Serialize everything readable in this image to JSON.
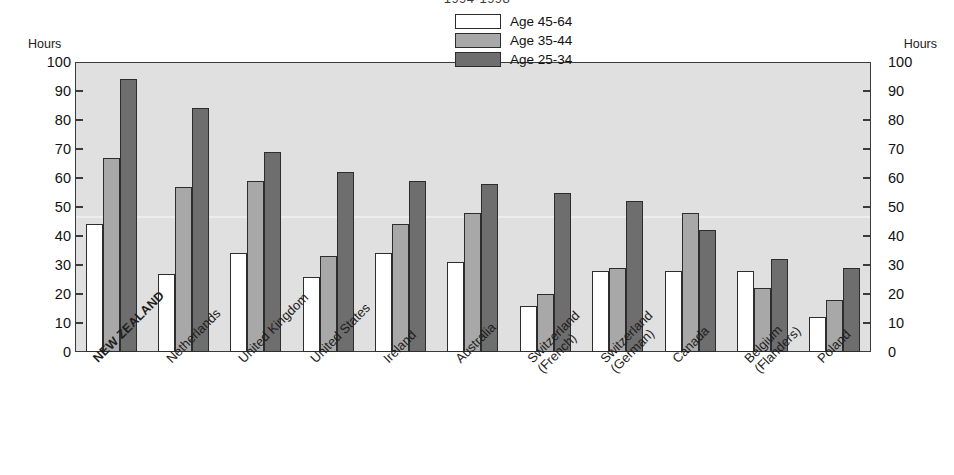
{
  "chart_data": {
    "type": "bar",
    "title": "1994-1998",
    "xlabel": "",
    "ylabel": "Hours",
    "ylabel_right": "Hours",
    "ylim": [
      0,
      100
    ],
    "yticks": [
      100,
      90,
      80,
      70,
      60,
      50,
      40,
      30,
      20,
      10,
      0
    ],
    "grid": false,
    "legend_position": "top-right inside plot",
    "categories": [
      "NEW ZEALAND",
      "Netherlands",
      "United Kingdom",
      "United States",
      "Ireland",
      "Australia",
      "Switzerland\n(French)",
      "Switzerland\n(German)",
      "Canada",
      "Belgium\n(Flanders)",
      "Poland"
    ],
    "emphasis_category": "NEW ZEALAND",
    "series": [
      {
        "name": "Age 45-64",
        "color": "#ffffff",
        "values": [
          44,
          27,
          34,
          26,
          34,
          31,
          16,
          28,
          28,
          28,
          12
        ]
      },
      {
        "name": "Age 35-44",
        "color": "#a8a8a8",
        "values": [
          67,
          57,
          59,
          33,
          44,
          48,
          20,
          29,
          48,
          22,
          18
        ]
      },
      {
        "name": "Age 25-34",
        "color": "#6e6e6e",
        "values": [
          94,
          84,
          69,
          62,
          59,
          58,
          55,
          52,
          42,
          32,
          29
        ]
      }
    ]
  }
}
